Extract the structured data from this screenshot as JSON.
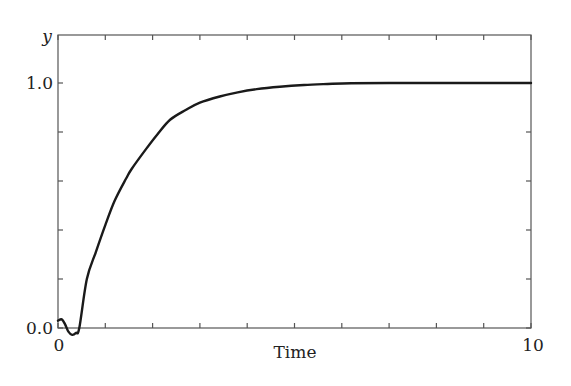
{
  "chart_data": {
    "type": "line",
    "title": "",
    "xlabel": "Time",
    "ylabel": "y",
    "xlim": [
      0,
      10
    ],
    "ylim": [
      -0.0,
      1.2
    ],
    "grid": false,
    "legend": null,
    "x_tick_labels": [
      {
        "value": 0,
        "label": "0"
      },
      {
        "value": 10,
        "label": "10"
      }
    ],
    "x_minor_ticks": [
      1,
      2,
      3,
      4,
      5,
      6,
      7,
      8,
      9
    ],
    "y_tick_labels": [
      {
        "value": 0.0,
        "label": "0.0"
      },
      {
        "value": 1.0,
        "label": "1.0"
      }
    ],
    "y_minor_ticks": [
      0.2,
      0.4,
      0.6,
      0.8
    ],
    "series": [
      {
        "name": "y",
        "color": "#1a1a1a",
        "x": [
          0,
          0.08,
          0.15,
          0.22,
          0.3,
          0.38,
          0.45,
          0.61,
          0.8,
          1.0,
          1.2,
          1.44,
          1.56,
          1.86,
          2.1,
          2.37,
          2.7,
          3.0,
          3.42,
          3.8,
          4.2,
          4.69,
          5.2,
          5.7,
          6.2,
          7.0,
          8.0,
          9.0,
          10.0
        ],
        "y": [
          0.03,
          0.035,
          0.015,
          -0.015,
          -0.028,
          -0.02,
          0.0,
          0.2,
          0.31,
          0.42,
          0.52,
          0.61,
          0.65,
          0.73,
          0.79,
          0.85,
          0.89,
          0.92,
          0.945,
          0.962,
          0.975,
          0.985,
          0.992,
          0.996,
          0.999,
          1.0,
          1.0,
          1.0,
          1.0
        ]
      }
    ]
  },
  "labels": {
    "x_axis": "Time",
    "y_axis": "y",
    "x_tick_0": "0",
    "x_tick_10": "10",
    "y_tick_0": "0.0",
    "y_tick_1": "1.0"
  }
}
